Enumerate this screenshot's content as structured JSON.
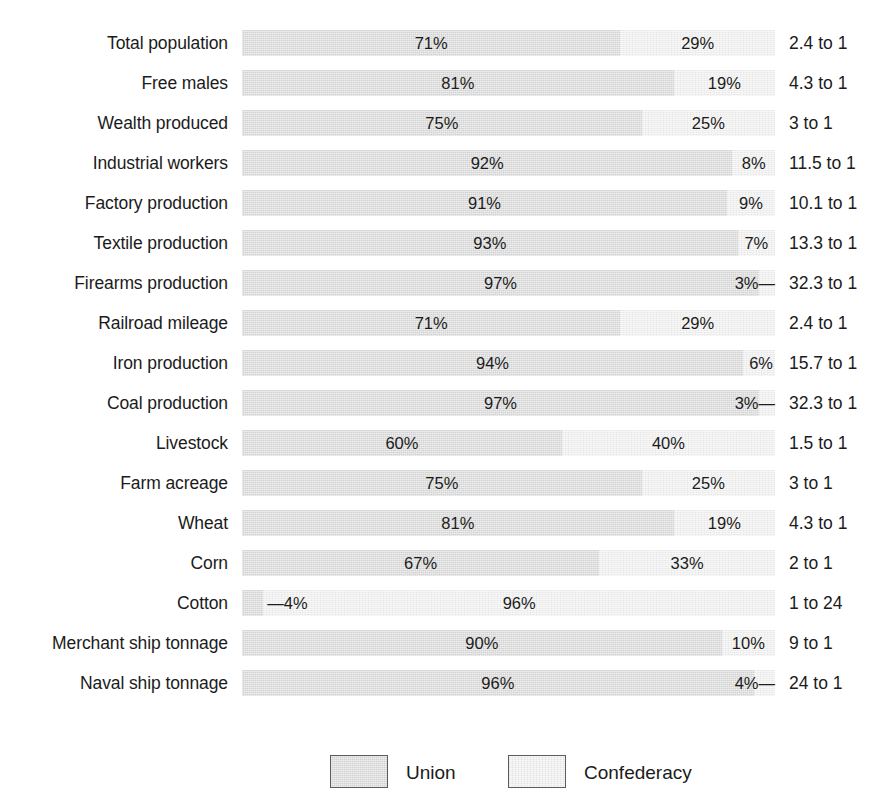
{
  "chart_data": {
    "type": "bar",
    "subtype": "stacked-horizontal-100pct",
    "title": "",
    "xlabel": "",
    "ylabel": "",
    "xlim": [
      0,
      100
    ],
    "grid": false,
    "legend_position": "bottom",
    "categories": [
      "Total population",
      "Free males",
      "Wealth produced",
      "Industrial workers",
      "Factory production",
      "Textile production",
      "Firearms production",
      "Railroad mileage",
      "Iron production",
      "Coal production",
      "Livestock",
      "Farm acreage",
      "Wheat",
      "Corn",
      "Cotton",
      "Merchant ship tonnage",
      "Naval ship tonnage"
    ],
    "series": [
      {
        "name": "Union",
        "color": "#d2d2d2",
        "values": [
          71,
          81,
          75,
          92,
          91,
          93,
          97,
          71,
          94,
          97,
          60,
          75,
          81,
          67,
          4,
          90,
          96
        ]
      },
      {
        "name": "Confederacy",
        "color": "#efefef",
        "values": [
          29,
          19,
          25,
          8,
          9,
          7,
          3,
          29,
          6,
          3,
          40,
          25,
          19,
          33,
          96,
          10,
          4
        ]
      }
    ],
    "annotations": [
      "2.4 to 1",
      "4.3 to 1",
      "3 to 1",
      "11.5 to 1",
      "10.1 to 1",
      "13.3 to 1",
      "32.3 to 1",
      "2.4 to 1",
      "15.7 to 1",
      "32.3 to 1",
      "1.5 to 1",
      "3 to 1",
      "4.3 to 1",
      "2 to 1",
      "1 to 24",
      "9 to 1",
      "24 to 1"
    ]
  },
  "rows": [
    {
      "label": "Total population",
      "union": 71,
      "conf": 29,
      "union_label": "71%",
      "conf_label": "29%",
      "ratio": "2.4 to 1",
      "leader": "none"
    },
    {
      "label": "Free males",
      "union": 81,
      "conf": 19,
      "union_label": "81%",
      "conf_label": "19%",
      "ratio": "4.3 to 1",
      "leader": "none"
    },
    {
      "label": "Wealth produced",
      "union": 75,
      "conf": 25,
      "union_label": "75%",
      "conf_label": "25%",
      "ratio": "3 to 1",
      "leader": "none"
    },
    {
      "label": "Industrial workers",
      "union": 92,
      "conf": 8,
      "union_label": "92%",
      "conf_label": "8%",
      "ratio": "11.5 to 1",
      "leader": "none"
    },
    {
      "label": "Factory production",
      "union": 91,
      "conf": 9,
      "union_label": "91%",
      "conf_label": "9%",
      "ratio": "10.1 to 1",
      "leader": "none"
    },
    {
      "label": "Textile production",
      "union": 93,
      "conf": 7,
      "union_label": "93%",
      "conf_label": "7%",
      "ratio": "13.3 to 1",
      "leader": "none"
    },
    {
      "label": "Firearms production",
      "union": 97,
      "conf": 3,
      "union_label": "97%",
      "conf_label": "3%—",
      "ratio": "32.3 to 1",
      "leader": "right"
    },
    {
      "label": "Railroad mileage",
      "union": 71,
      "conf": 29,
      "union_label": "71%",
      "conf_label": "29%",
      "ratio": "2.4 to 1",
      "leader": "none"
    },
    {
      "label": "Iron production",
      "union": 94,
      "conf": 6,
      "union_label": "94%",
      "conf_label": "6%",
      "ratio": "15.7 to 1",
      "leader": "none"
    },
    {
      "label": "Coal production",
      "union": 97,
      "conf": 3,
      "union_label": "97%",
      "conf_label": "3%—",
      "ratio": "32.3 to 1",
      "leader": "right"
    },
    {
      "label": "Livestock",
      "union": 60,
      "conf": 40,
      "union_label": "60%",
      "conf_label": "40%",
      "ratio": "1.5 to 1",
      "leader": "none"
    },
    {
      "label": "Farm acreage",
      "union": 75,
      "conf": 25,
      "union_label": "75%",
      "conf_label": "25%",
      "ratio": "3 to 1",
      "leader": "none"
    },
    {
      "label": "Wheat",
      "union": 81,
      "conf": 19,
      "union_label": "81%",
      "conf_label": "19%",
      "ratio": "4.3 to 1",
      "leader": "none"
    },
    {
      "label": "Corn",
      "union": 67,
      "conf": 33,
      "union_label": "67%",
      "conf_label": "33%",
      "ratio": "2 to 1",
      "leader": "none"
    },
    {
      "label": "Cotton",
      "union": 4,
      "conf": 96,
      "union_label": "—4%",
      "conf_label": "96%",
      "ratio": "1 to 24",
      "leader": "left"
    },
    {
      "label": "Merchant ship tonnage",
      "union": 90,
      "conf": 10,
      "union_label": "90%",
      "conf_label": "10%",
      "ratio": "9 to 1",
      "leader": "none"
    },
    {
      "label": "Naval ship tonnage",
      "union": 96,
      "conf": 4,
      "union_label": "96%",
      "conf_label": "4%—",
      "ratio": "24 to 1",
      "leader": "right"
    }
  ],
  "legend": {
    "items": [
      {
        "label": "Union",
        "color": "#d2d2d2",
        "swatch": "union"
      },
      {
        "label": "Confederacy",
        "color": "#efefef",
        "swatch": "conf"
      }
    ]
  }
}
